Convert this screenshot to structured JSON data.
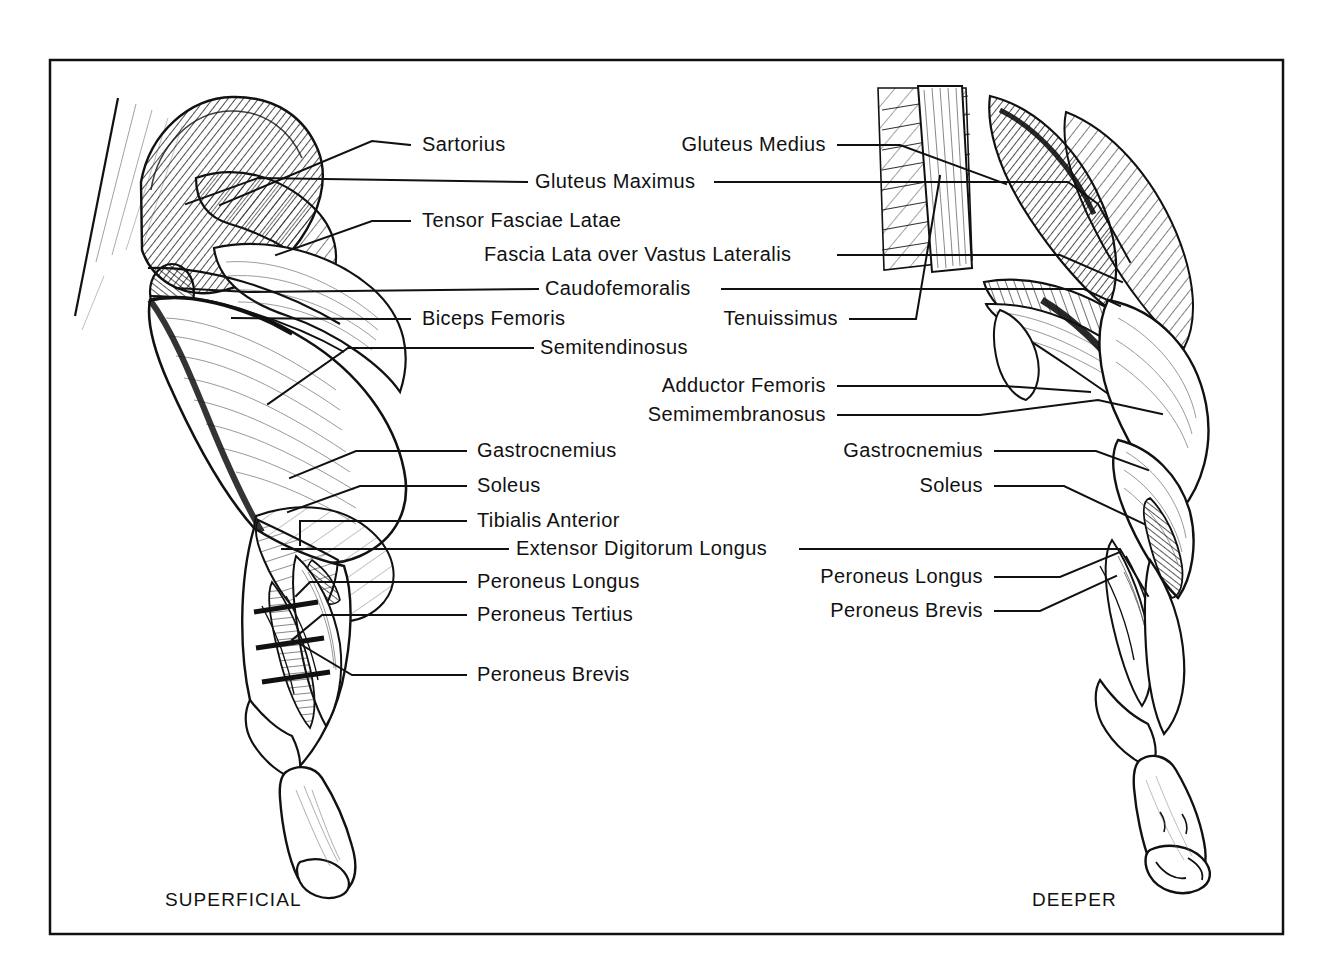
{
  "plate": {
    "title": "Hindlimb Musculature",
    "background_color": "#ffffff",
    "ink_color": "#111111",
    "frame": {
      "x": 50,
      "y": 60,
      "width": 1233,
      "height": 874
    }
  },
  "captions": [
    {
      "key": "superficial",
      "text": "SUPERFICIAL",
      "x": 165,
      "y": 906
    },
    {
      "key": "deeper",
      "text": "DEEPER",
      "x": 1032,
      "y": 906
    }
  ],
  "labels_left": [
    {
      "key": "sartorius",
      "text": "Sartorius",
      "x": 422,
      "y": 151
    },
    {
      "key": "gluteus-maximus",
      "text": "Gluteus Maximus",
      "x": 535,
      "y": 188
    },
    {
      "key": "tensor-fasciae-latae",
      "text": "Tensor Fasciae Latae",
      "x": 422,
      "y": 227
    },
    {
      "key": "fascia-lata-over-vastus-lateralis",
      "text": "Fascia Lata over Vastus Lateralis",
      "x": 484,
      "y": 261
    },
    {
      "key": "caudofemoralis",
      "text": "Caudofemoralis",
      "x": 545,
      "y": 295
    },
    {
      "key": "biceps-femoris",
      "text": "Biceps Femoris",
      "x": 422,
      "y": 325
    },
    {
      "key": "semitendinosus",
      "text": "Semitendinosus",
      "x": 540,
      "y": 354
    },
    {
      "key": "gastrocnemius-left",
      "text": "Gastrocnemius",
      "x": 477,
      "y": 457
    },
    {
      "key": "soleus-left",
      "text": "Soleus",
      "x": 477,
      "y": 492
    },
    {
      "key": "tibialis-anterior",
      "text": "Tibialis Anterior",
      "x": 477,
      "y": 527
    },
    {
      "key": "extensor-digitorum-longus",
      "text": "Extensor Digitorum Longus",
      "x": 516,
      "y": 555
    },
    {
      "key": "peroneus-longus-left",
      "text": "Peroneus Longus",
      "x": 477,
      "y": 588
    },
    {
      "key": "peroneus-tertius",
      "text": "Peroneus Tertius",
      "x": 477,
      "y": 621
    },
    {
      "key": "peroneus-brevis-left",
      "text": "Peroneus Brevis",
      "x": 477,
      "y": 681
    }
  ],
  "labels_right": [
    {
      "key": "gluteus-medius",
      "text": "Gluteus Medius",
      "x": 826,
      "y": 151,
      "anchor": "end"
    },
    {
      "key": "tenuissimus",
      "text": "Tenuissimus",
      "x": 838,
      "y": 325,
      "anchor": "end"
    },
    {
      "key": "adductor-femoris",
      "text": "Adductor Femoris",
      "x": 826,
      "y": 392,
      "anchor": "end"
    },
    {
      "key": "semimembranosus",
      "text": "Semimembranosus",
      "x": 826,
      "y": 421,
      "anchor": "end"
    },
    {
      "key": "gastrocnemius-right",
      "text": "Gastrocnemius",
      "x": 983,
      "y": 457,
      "anchor": "end"
    },
    {
      "key": "soleus-right",
      "text": "Soleus",
      "x": 983,
      "y": 492,
      "anchor": "end"
    },
    {
      "key": "peroneus-longus-right",
      "text": "Peroneus Longus",
      "x": 983,
      "y": 583,
      "anchor": "end"
    },
    {
      "key": "peroneus-brevis-right",
      "text": "Peroneus Brevis",
      "x": 983,
      "y": 617,
      "anchor": "end"
    }
  ],
  "figures": [
    {
      "key": "superficial-limb",
      "description": "Lateral view of dog hindlimb, superficial dissection, skin removed showing gluteal, thigh and crural muscle groups with paw at lower right."
    },
    {
      "key": "deeper-limb",
      "description": "Lateral view of dog hindlimb, deeper dissection, superficial muscles reflected exposing adductor, semimembranosus and deep crural muscles."
    }
  ]
}
